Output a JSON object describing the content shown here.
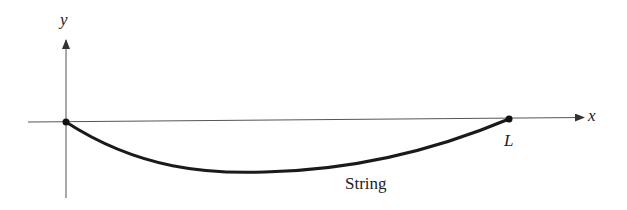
{
  "diagram": {
    "axes": {
      "x_label": "x",
      "y_label": "y"
    },
    "points": [
      {
        "name": "origin",
        "label": ""
      },
      {
        "name": "end-point",
        "label": "L"
      }
    ],
    "curve_label": "String",
    "colors": {
      "axis": "#555555",
      "curve": "#1a1a1a",
      "text": "#222222"
    }
  }
}
